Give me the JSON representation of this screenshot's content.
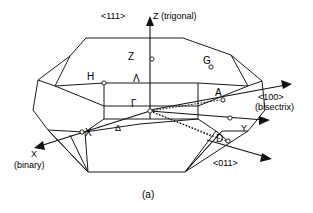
{
  "figure": {
    "caption": "(a)",
    "type": "brillouin-zone-diagram",
    "line_color": "#111111",
    "background_color": "#ffffff"
  },
  "axes": [
    {
      "key": "z",
      "name": "z-axis",
      "label": "Z (trigonal)",
      "direction_label": "<111>",
      "arrow": "up"
    },
    {
      "key": "x",
      "name": "x-axis",
      "label": "X",
      "sub_label": "(binary)",
      "direction_label": "",
      "arrow": "down-left"
    },
    {
      "key": "y",
      "name": "y-axis",
      "label": "Y",
      "direction_label": "",
      "arrow": "right"
    },
    {
      "key": "bisectrix",
      "name": "bisectrix-axis",
      "label": "",
      "direction_label": "<100>",
      "sub_label": "(bisectrix)",
      "arrow": "up-right"
    },
    {
      "key": "oblique",
      "name": "oblique-direction",
      "label": "",
      "direction_label": "<011>",
      "arrow": "down-right"
    }
  ],
  "symmetry_points": [
    {
      "key": "gamma",
      "name": "point-gamma",
      "label": "Γ",
      "marker": true
    },
    {
      "key": "z",
      "name": "point-z",
      "label": "Z",
      "marker": true
    },
    {
      "key": "h",
      "name": "point-h",
      "label": "H",
      "marker": true
    },
    {
      "key": "g",
      "name": "point-g",
      "label": "G",
      "marker": true
    },
    {
      "key": "a",
      "name": "point-a",
      "label": "A",
      "marker": true
    },
    {
      "key": "x",
      "name": "point-x",
      "label": "X",
      "marker": true
    },
    {
      "key": "d",
      "name": "point-d",
      "label": "D",
      "marker": true
    },
    {
      "key": "y_pt",
      "name": "point-on-y-axis",
      "label": "",
      "marker": true
    }
  ],
  "symmetry_lines": [
    {
      "key": "lambda",
      "name": "line-lambda",
      "label": "Λ"
    },
    {
      "key": "delta",
      "name": "line-delta",
      "label": "Δ"
    }
  ]
}
